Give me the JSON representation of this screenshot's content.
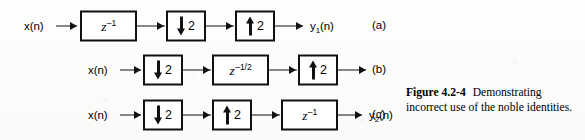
{
  "figure": {
    "caption_label": "Figure 4.2-4",
    "caption_text": "Demonstrating incorrect use of the noble identities."
  },
  "rows": [
    {
      "part_label": "(a)",
      "input_label": "x(n)",
      "output_label": "y",
      "output_sub": "1",
      "output_tail": "(n)",
      "blocks": [
        {
          "kind": "delay",
          "symbol": "z",
          "exponent": "–1",
          "label": "z^-1"
        },
        {
          "kind": "decimator",
          "arrow": "down-arrow-icon",
          "factor": "2"
        },
        {
          "kind": "expander",
          "arrow": "up-arrow-icon",
          "factor": "2"
        }
      ]
    },
    {
      "part_label": "(b)",
      "input_label": "x(n)",
      "output_label": "",
      "output_sub": "",
      "output_tail": "",
      "blocks": [
        {
          "kind": "decimator",
          "arrow": "down-arrow-icon",
          "factor": "2"
        },
        {
          "kind": "delay",
          "symbol": "z",
          "exponent": "–1/2",
          "label": "z^-1/2"
        },
        {
          "kind": "expander",
          "arrow": "up-arrow-icon",
          "factor": "2"
        }
      ]
    },
    {
      "part_label": "(c)",
      "input_label": "x(n)",
      "output_label": "y",
      "output_sub": "2",
      "output_tail": "(n)",
      "blocks": [
        {
          "kind": "decimator",
          "arrow": "down-arrow-icon",
          "factor": "2"
        },
        {
          "kind": "expander",
          "arrow": "up-arrow-icon",
          "factor": "2"
        },
        {
          "kind": "delay",
          "symbol": "z",
          "exponent": "–1",
          "label": "z^-1"
        }
      ]
    }
  ],
  "colors": {
    "ink": "#111111",
    "paper": "#fdfdfc"
  }
}
